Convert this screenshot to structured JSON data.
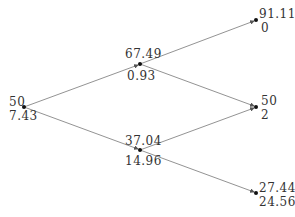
{
  "colors": {
    "edge": "#777777",
    "node": "#111111",
    "text": "#333333"
  },
  "nodes": [
    {
      "id": "root",
      "x": 24,
      "y": 107,
      "price": "50",
      "value": "7.43"
    },
    {
      "id": "u",
      "x": 140,
      "y": 64,
      "price": "67.49",
      "value": "0.93"
    },
    {
      "id": "d",
      "x": 140,
      "y": 150,
      "price": "37.04",
      "value": "14.96"
    },
    {
      "id": "uu",
      "x": 256,
      "y": 20,
      "price": "91.11",
      "value": "0"
    },
    {
      "id": "ud",
      "x": 256,
      "y": 107,
      "price": "50",
      "value": "2"
    },
    {
      "id": "dd",
      "x": 256,
      "y": 193,
      "price": "27.44",
      "value": "24.56"
    }
  ],
  "edges": [
    [
      "root",
      "u"
    ],
    [
      "root",
      "d"
    ],
    [
      "u",
      "uu"
    ],
    [
      "u",
      "ud"
    ],
    [
      "d",
      "ud"
    ],
    [
      "d",
      "dd"
    ]
  ]
}
